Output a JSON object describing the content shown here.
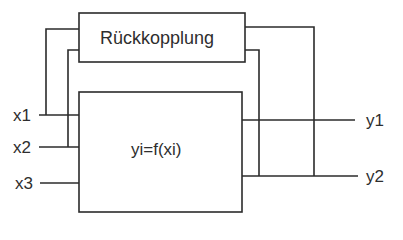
{
  "feedback_block": {
    "label": "Rückkopplung"
  },
  "system_block": {
    "label": "yi=f(xi)"
  },
  "inputs": [
    {
      "label": "x1"
    },
    {
      "label": "x2"
    },
    {
      "label": "x3"
    }
  ],
  "outputs": [
    {
      "label": "y1"
    },
    {
      "label": "y2"
    }
  ],
  "colors": {
    "line": "#2b2b2b",
    "background": "#ffffff"
  }
}
